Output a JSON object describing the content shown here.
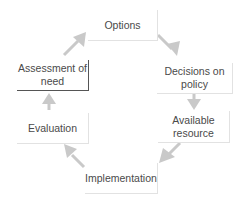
{
  "diagram": {
    "type": "cycle",
    "arrow_color": "#c9c9c9",
    "nodes": [
      {
        "id": "options",
        "label": "Options"
      },
      {
        "id": "decisions",
        "label": "Decisions on policy",
        "line1": "Decisions on",
        "line2": "policy"
      },
      {
        "id": "resource",
        "label": "Available resource",
        "line1": "Available",
        "line2": "resource"
      },
      {
        "id": "implementation",
        "label": "Implementation"
      },
      {
        "id": "evaluation",
        "label": "Evaluation"
      },
      {
        "id": "assessment",
        "label": "Assessment of need",
        "line1": "Assessment of",
        "line2": "need"
      }
    ],
    "edges": [
      {
        "from": "options",
        "to": "decisions"
      },
      {
        "from": "decisions",
        "to": "resource"
      },
      {
        "from": "resource",
        "to": "implementation"
      },
      {
        "from": "implementation",
        "to": "evaluation"
      },
      {
        "from": "evaluation",
        "to": "assessment"
      },
      {
        "from": "assessment",
        "to": "options"
      }
    ]
  }
}
